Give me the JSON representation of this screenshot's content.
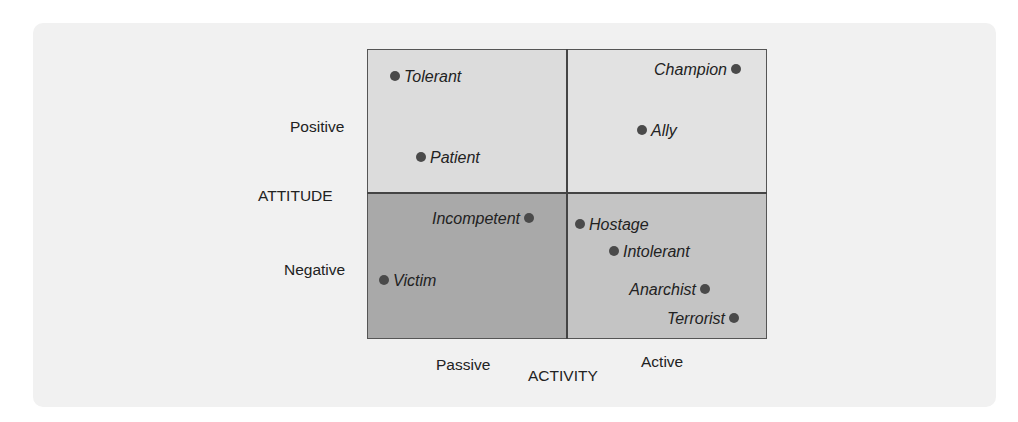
{
  "chart_data": {
    "type": "scatter",
    "title": "",
    "xlabel": "ACTIVITY",
    "ylabel": "ATTITUDE",
    "x_tick_labels": [
      "Passive",
      "Active"
    ],
    "y_tick_labels": [
      "Positive",
      "Negative"
    ],
    "grid": false,
    "quadrants": [
      {
        "name": "passive-positive",
        "color": "#dcdcdc"
      },
      {
        "name": "active-positive",
        "color": "#e2e2e2"
      },
      {
        "name": "passive-negative",
        "color": "#a9a9a9"
      },
      {
        "name": "active-negative",
        "color": "#c4c4c4"
      }
    ],
    "points": [
      {
        "label": "Tolerant",
        "quadrant": "passive-positive",
        "x": 395,
        "y": 76,
        "label_side": "right"
      },
      {
        "label": "Patient",
        "quadrant": "passive-positive",
        "x": 421,
        "y": 157,
        "label_side": "right"
      },
      {
        "label": "Champion",
        "quadrant": "active-positive",
        "x": 736,
        "y": 69,
        "label_side": "left"
      },
      {
        "label": "Ally",
        "quadrant": "active-positive",
        "x": 642,
        "y": 130,
        "label_side": "right"
      },
      {
        "label": "Incompetent",
        "quadrant": "passive-negative",
        "x": 529,
        "y": 218,
        "label_side": "left"
      },
      {
        "label": "Victim",
        "quadrant": "passive-negative",
        "x": 384,
        "y": 280,
        "label_side": "right"
      },
      {
        "label": "Hostage",
        "quadrant": "active-negative",
        "x": 580,
        "y": 224,
        "label_side": "right"
      },
      {
        "label": "Intolerant",
        "quadrant": "active-negative",
        "x": 614,
        "y": 251,
        "label_side": "right"
      },
      {
        "label": "Anarchist",
        "quadrant": "active-negative",
        "x": 705,
        "y": 289,
        "label_side": "left"
      },
      {
        "label": "Terrorist",
        "quadrant": "active-negative",
        "x": 734,
        "y": 318,
        "label_side": "left"
      }
    ]
  },
  "axes": {
    "y_title": "ATTITUDE",
    "y_positive": "Positive",
    "y_negative": "Negative",
    "x_title": "ACTIVITY",
    "x_passive": "Passive",
    "x_active": "Active"
  },
  "colors": {
    "panel_bg": "#f1f1f1",
    "q_passive_positive": "#dcdcdc",
    "q_active_positive": "#e2e2e2",
    "q_passive_negative": "#a9a9a9",
    "q_active_negative": "#c4c4c4",
    "dot": "#4a4a4a"
  }
}
